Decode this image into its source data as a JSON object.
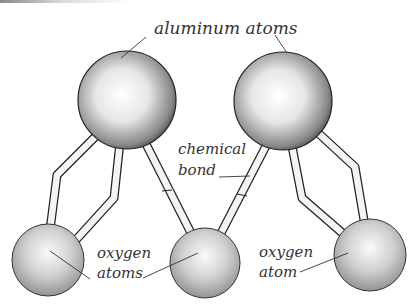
{
  "diagram": {
    "labels": {
      "aluminum": "aluminum atoms",
      "bond_line1": "chemical",
      "bond_line2": "bond",
      "oxygen_left_line1": "oxygen",
      "oxygen_left_line2": "atoms",
      "oxygen_right_line1": "oxygen",
      "oxygen_right_line2": "atom"
    },
    "nodes": [
      {
        "id": "al1",
        "type": "aluminum"
      },
      {
        "id": "al2",
        "type": "aluminum"
      },
      {
        "id": "o1",
        "type": "oxygen"
      },
      {
        "id": "o2",
        "type": "oxygen"
      },
      {
        "id": "o3",
        "type": "oxygen"
      }
    ]
  }
}
